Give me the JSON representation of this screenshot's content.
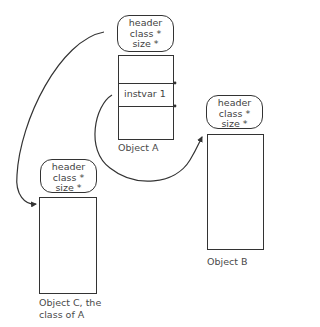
{
  "diagram": {
    "objects": [
      {
        "id": "A",
        "header": [
          "header",
          "class *",
          "size *"
        ],
        "slots": [
          "",
          "instvar 1",
          ""
        ],
        "label": [
          "Object A"
        ]
      },
      {
        "id": "B",
        "header": [
          "header",
          "class *",
          "size *"
        ],
        "slots": [],
        "label": [
          "Object B"
        ]
      },
      {
        "id": "C",
        "header": [
          "header",
          "class *",
          "size *"
        ],
        "slots": [],
        "label": [
          "Object C, the",
          "class of  A"
        ]
      }
    ],
    "arrows": [
      {
        "from": "A.header.class",
        "to": "C",
        "meaning": "class pointer"
      },
      {
        "from": "A.instvar 1",
        "to": "B",
        "meaning": "instance variable reference"
      }
    ],
    "colors": {
      "line": "#333333",
      "text": "#3f3f3f",
      "background": "#ffffff"
    }
  }
}
